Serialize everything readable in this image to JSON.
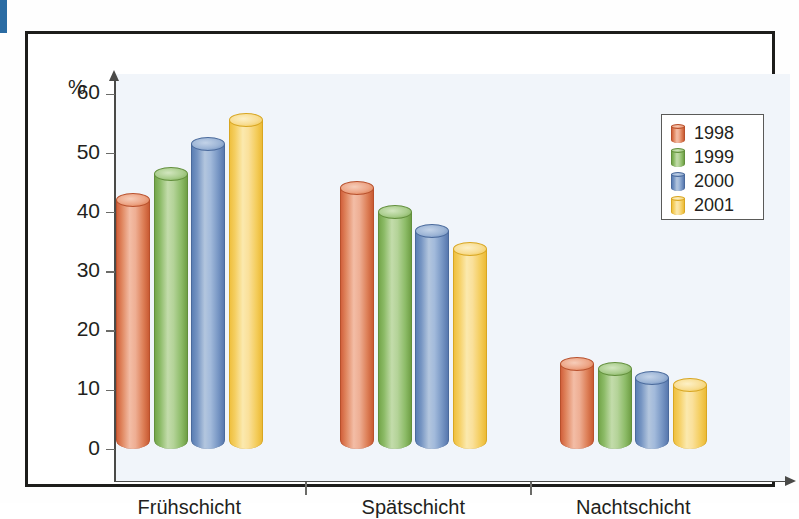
{
  "figure": {
    "margin_tab_color": "#2b6ca3",
    "frame_color": "#1d1d1b",
    "plot_background": "#f1f5fa"
  },
  "axis": {
    "unit_label": "%",
    "y_ticks": [
      "60",
      "50",
      "40",
      "30",
      "20",
      "10",
      "0"
    ],
    "y_tick_values": [
      60,
      50,
      40,
      30,
      20,
      10,
      0
    ]
  },
  "legend": {
    "items": [
      {
        "label": "1998",
        "color": "#e07a5a"
      },
      {
        "label": "1999",
        "color": "#8fbc6a"
      },
      {
        "label": "2000",
        "color": "#7e9fc8"
      },
      {
        "label": "2001",
        "color": "#f5cf64"
      }
    ]
  },
  "categories": [
    "Frühschicht",
    "Spätschicht",
    "Nachtschicht"
  ],
  "chart_data": {
    "type": "bar",
    "title": "",
    "xlabel": "",
    "ylabel": "%",
    "ylim": [
      0,
      65
    ],
    "grid": false,
    "legend_position": "top-right",
    "categories": [
      "Frühschicht",
      "Spätschicht",
      "Nachtschicht"
    ],
    "series": [
      {
        "name": "1998",
        "color": "#e07a5a",
        "values": [
          42.0,
          44.0,
          14.2
        ]
      },
      {
        "name": "1999",
        "color": "#8fbc6a",
        "values": [
          46.3,
          40.0,
          13.5
        ]
      },
      {
        "name": "2000",
        "color": "#7e9fc8",
        "values": [
          51.5,
          36.8,
          11.9
        ]
      },
      {
        "name": "2001",
        "color": "#f5cf64",
        "values": [
          55.5,
          33.7,
          10.8
        ]
      }
    ]
  }
}
